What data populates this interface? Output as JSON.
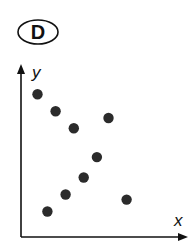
{
  "label": "D",
  "chart_data": {
    "type": "scatter",
    "title": "D",
    "xlabel": "x",
    "ylabel": "y",
    "grid": false,
    "ticks": false,
    "points": [
      {
        "x": 1.0,
        "y": 8.4
      },
      {
        "x": 2.1,
        "y": 7.4
      },
      {
        "x": 3.2,
        "y": 6.4
      },
      {
        "x": 5.3,
        "y": 7.0
      },
      {
        "x": 4.6,
        "y": 4.7
      },
      {
        "x": 3.8,
        "y": 3.5
      },
      {
        "x": 2.7,
        "y": 2.5
      },
      {
        "x": 1.6,
        "y": 1.5
      },
      {
        "x": 6.4,
        "y": 2.2
      }
    ],
    "xlim": [
      0,
      9
    ],
    "ylim": [
      0,
      10
    ]
  },
  "style": {
    "axis_color": "#111111",
    "point_color": "#2b2b2b"
  }
}
